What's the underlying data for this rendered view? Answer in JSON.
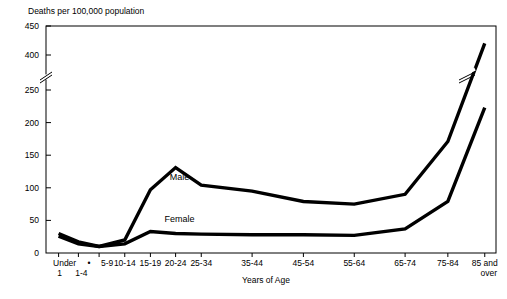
{
  "chart_data": {
    "type": "line",
    "title": "",
    "ylabel": "Deaths per 100,000 population",
    "xlabel": "Years of Age",
    "grid": false,
    "legend_position": "inline-annotation",
    "axis_break": {
      "present": true,
      "between": [
        400,
        250
      ]
    },
    "categories": [
      "Under 1",
      "1-4",
      "5-9",
      "10-14",
      "15-19",
      "20-24",
      "25-34",
      "35-44",
      "45-54",
      "55-64",
      "65-74",
      "75-84",
      "85 and over"
    ],
    "category_labels_line1": [
      "Under",
      "1-4",
      "5-9",
      "10-14",
      "15-19",
      "20-24",
      "25-34",
      "35-44",
      "45-54",
      "55-64",
      "65-74",
      "75-84",
      "85 and"
    ],
    "category_labels_line2": [
      "1",
      "",
      "",
      "",
      "",
      "",
      "",
      "",
      "",
      "",
      "",
      "",
      "over"
    ],
    "ytick_labels": [
      "0",
      "50",
      "100",
      "150",
      "200",
      "250",
      "400",
      "450"
    ],
    "ytick_values": [
      0,
      50,
      100,
      150,
      200,
      250,
      400,
      450
    ],
    "ylim": [
      0,
      450
    ],
    "series": [
      {
        "name": "Male",
        "values": [
          30,
          17,
          10,
          20,
          97,
          131,
          104,
          95,
          79,
          75,
          90,
          171,
          420
        ]
      },
      {
        "name": "Female",
        "values": [
          26,
          14,
          10,
          14,
          33,
          30,
          29,
          28,
          28,
          27,
          37,
          79,
          223
        ]
      }
    ],
    "annotations": [
      {
        "text": "Male",
        "category": "20-24",
        "value": 112
      },
      {
        "text": "Female",
        "category": "20-24",
        "value": 47
      }
    ]
  },
  "colors": {
    "line": "#000000",
    "axis": "#000000",
    "background": "#ffffff"
  }
}
